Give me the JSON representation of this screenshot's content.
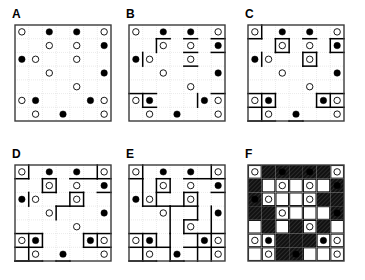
{
  "figure": {
    "grid_size": 7,
    "panel_count": 6,
    "colors": {
      "background": "#ffffff",
      "border": "#3a3a3a",
      "gridline": "#c9c9c9",
      "region_line": "#000000",
      "dot_filled": "#000000",
      "dot_open": "#ffffff",
      "dot_stroke": "#000000",
      "shaded_region": "#111111",
      "label": "#000000"
    }
  },
  "dots": [
    {
      "r": 0,
      "c": 0,
      "type": "open"
    },
    {
      "r": 0,
      "c": 2,
      "type": "filled"
    },
    {
      "r": 0,
      "c": 4,
      "type": "filled"
    },
    {
      "r": 0,
      "c": 6,
      "type": "open"
    },
    {
      "r": 1,
      "c": 2,
      "type": "open"
    },
    {
      "r": 1,
      "c": 4,
      "type": "open"
    },
    {
      "r": 1,
      "c": 6,
      "type": "filled"
    },
    {
      "r": 2,
      "c": 0,
      "type": "filled"
    },
    {
      "r": 2,
      "c": 1,
      "type": "open"
    },
    {
      "r": 2,
      "c": 4,
      "type": "open"
    },
    {
      "r": 3,
      "c": 2,
      "type": "open"
    },
    {
      "r": 3,
      "c": 6,
      "type": "filled"
    },
    {
      "r": 4,
      "c": 4,
      "type": "open"
    },
    {
      "r": 5,
      "c": 0,
      "type": "open"
    },
    {
      "r": 5,
      "c": 1,
      "type": "filled"
    },
    {
      "r": 5,
      "c": 5,
      "type": "filled"
    },
    {
      "r": 5,
      "c": 6,
      "type": "open"
    },
    {
      "r": 6,
      "c": 1,
      "type": "open"
    },
    {
      "r": 6,
      "c": 3,
      "type": "filled"
    },
    {
      "r": 6,
      "c": 6,
      "type": "open"
    },
    {
      "r": 7,
      "c": 2,
      "type": "open"
    },
    {
      "r": 7,
      "c": 5,
      "type": "open"
    }
  ],
  "panels": [
    {
      "id": "a",
      "label": "A",
      "caption": "initial grid with clue dots",
      "shaded": false,
      "cell_labels": [],
      "segments": []
    },
    {
      "id": "b",
      "label": "B",
      "caption": "first deduced region edges",
      "shaded": false,
      "cell_labels": [],
      "segments": [
        {
          "x1": 2,
          "y1": 1,
          "x2": 3,
          "y2": 1
        },
        {
          "x1": 2,
          "y1": 1,
          "x2": 2,
          "y2": 2
        },
        {
          "x1": 4,
          "y1": 1,
          "x2": 5,
          "y2": 1
        },
        {
          "x1": 6,
          "y1": 1,
          "x2": 7,
          "y2": 1
        },
        {
          "x1": 6,
          "y1": 2,
          "x2": 7,
          "y2": 2
        },
        {
          "x1": 1,
          "y1": 2,
          "x2": 1,
          "y2": 3
        },
        {
          "x1": 4,
          "y1": 2,
          "x2": 5,
          "y2": 2
        },
        {
          "x1": 4,
          "y1": 3,
          "x2": 5,
          "y2": 3
        },
        {
          "x1": 1,
          "y1": 5,
          "x2": 1,
          "y2": 6
        },
        {
          "x1": 5,
          "y1": 5,
          "x2": 5,
          "y2": 6
        },
        {
          "x1": 6,
          "y1": 5,
          "x2": 7,
          "y2": 5
        },
        {
          "x1": 0,
          "y1": 5,
          "x2": 2,
          "y2": 5
        },
        {
          "x1": 1,
          "y1": 6,
          "x2": 2,
          "y2": 6
        }
      ]
    },
    {
      "id": "c",
      "label": "C",
      "caption": "more regions closed off",
      "shaded": false,
      "cell_labels": [],
      "segments": [
        {
          "x1": 0,
          "y1": 1,
          "x2": 1,
          "y2": 1
        },
        {
          "x1": 1,
          "y1": 0,
          "x2": 1,
          "y2": 1
        },
        {
          "x1": 2,
          "y1": 1,
          "x2": 3,
          "y2": 1
        },
        {
          "x1": 2,
          "y1": 1,
          "x2": 2,
          "y2": 2
        },
        {
          "x1": 3,
          "y1": 1,
          "x2": 3,
          "y2": 2
        },
        {
          "x1": 2,
          "y1": 2,
          "x2": 3,
          "y2": 2
        },
        {
          "x1": 4,
          "y1": 1,
          "x2": 5,
          "y2": 1
        },
        {
          "x1": 6,
          "y1": 1,
          "x2": 7,
          "y2": 1
        },
        {
          "x1": 6,
          "y1": 1,
          "x2": 6,
          "y2": 2
        },
        {
          "x1": 6,
          "y1": 2,
          "x2": 7,
          "y2": 2
        },
        {
          "x1": 1,
          "y1": 2,
          "x2": 1,
          "y2": 3
        },
        {
          "x1": 4,
          "y1": 2,
          "x2": 5,
          "y2": 2
        },
        {
          "x1": 4,
          "y1": 2,
          "x2": 4,
          "y2": 3
        },
        {
          "x1": 5,
          "y1": 2,
          "x2": 5,
          "y2": 3
        },
        {
          "x1": 4,
          "y1": 3,
          "x2": 5,
          "y2": 3
        },
        {
          "x1": 0,
          "y1": 5,
          "x2": 2,
          "y2": 5
        },
        {
          "x1": 1,
          "y1": 5,
          "x2": 1,
          "y2": 6
        },
        {
          "x1": 2,
          "y1": 5,
          "x2": 2,
          "y2": 6
        },
        {
          "x1": 0,
          "y1": 6,
          "x2": 2,
          "y2": 6
        },
        {
          "x1": 1,
          "y1": 6,
          "x2": 1,
          "y2": 7
        },
        {
          "x1": 0,
          "y1": 7,
          "x2": 2,
          "y2": 7
        },
        {
          "x1": 5,
          "y1": 5,
          "x2": 5,
          "y2": 6
        },
        {
          "x1": 5,
          "y1": 5,
          "x2": 7,
          "y2": 5
        },
        {
          "x1": 6,
          "y1": 5,
          "x2": 6,
          "y2": 6
        },
        {
          "x1": 5,
          "y1": 6,
          "x2": 7,
          "y2": 6
        },
        {
          "x1": 3,
          "y1": 7,
          "x2": 3,
          "y2": 8
        },
        {
          "x1": 4,
          "y1": 7,
          "x2": 4,
          "y2": 8
        },
        {
          "x1": 3,
          "y1": 7,
          "x2": 4,
          "y2": 7
        }
      ]
    },
    {
      "id": "d",
      "label": "D",
      "caption": "case analysis at cells a and b",
      "shaded": false,
      "cell_labels": [
        {
          "r": 7,
          "c": 0,
          "text": "a"
        },
        {
          "r": 7,
          "c": 2,
          "text": "b"
        }
      ],
      "segments": [
        {
          "x1": 0,
          "y1": 1,
          "x2": 1,
          "y2": 1
        },
        {
          "x1": 1,
          "y1": 0,
          "x2": 1,
          "y2": 1
        },
        {
          "x1": 2,
          "y1": 1,
          "x2": 3,
          "y2": 1
        },
        {
          "x1": 2,
          "y1": 1,
          "x2": 2,
          "y2": 2
        },
        {
          "x1": 3,
          "y1": 1,
          "x2": 3,
          "y2": 2
        },
        {
          "x1": 2,
          "y1": 2,
          "x2": 3,
          "y2": 2
        },
        {
          "x1": 4,
          "y1": 1,
          "x2": 6,
          "y2": 1
        },
        {
          "x1": 6,
          "y1": 0,
          "x2": 6,
          "y2": 1
        },
        {
          "x1": 6,
          "y1": 1,
          "x2": 7,
          "y2": 1
        },
        {
          "x1": 6,
          "y1": 2,
          "x2": 7,
          "y2": 2
        },
        {
          "x1": 1,
          "y1": 2,
          "x2": 1,
          "y2": 3
        },
        {
          "x1": 4,
          "y1": 2,
          "x2": 5,
          "y2": 2
        },
        {
          "x1": 4,
          "y1": 2,
          "x2": 4,
          "y2": 3
        },
        {
          "x1": 5,
          "y1": 2,
          "x2": 5,
          "y2": 3
        },
        {
          "x1": 3,
          "y1": 3,
          "x2": 5,
          "y2": 3
        },
        {
          "x1": 3,
          "y1": 3,
          "x2": 3,
          "y2": 4
        },
        {
          "x1": 0,
          "y1": 5,
          "x2": 2,
          "y2": 5
        },
        {
          "x1": 1,
          "y1": 5,
          "x2": 1,
          "y2": 6
        },
        {
          "x1": 2,
          "y1": 5,
          "x2": 2,
          "y2": 6
        },
        {
          "x1": 0,
          "y1": 6,
          "x2": 2,
          "y2": 6
        },
        {
          "x1": 1,
          "y1": 6,
          "x2": 1,
          "y2": 7
        },
        {
          "x1": 0,
          "y1": 7,
          "x2": 2,
          "y2": 7
        },
        {
          "x1": 5,
          "y1": 5,
          "x2": 5,
          "y2": 6
        },
        {
          "x1": 5,
          "y1": 5,
          "x2": 7,
          "y2": 5
        },
        {
          "x1": 6,
          "y1": 5,
          "x2": 6,
          "y2": 6
        },
        {
          "x1": 5,
          "y1": 6,
          "x2": 7,
          "y2": 6
        },
        {
          "x1": 0,
          "y1": 7,
          "x2": 1,
          "y2": 7
        },
        {
          "x1": 1,
          "y1": 7,
          "x2": 1,
          "y2": 8
        },
        {
          "x1": 2,
          "y1": 7,
          "x2": 2,
          "y2": 8
        },
        {
          "x1": 3,
          "y1": 7,
          "x2": 3,
          "y2": 8
        },
        {
          "x1": 4,
          "y1": 7,
          "x2": 4,
          "y2": 8
        },
        {
          "x1": 3,
          "y1": 7,
          "x2": 4,
          "y2": 7
        }
      ]
    },
    {
      "id": "e",
      "label": "E",
      "caption": "completed domino partition",
      "shaded": false,
      "cell_labels": [],
      "segments": [
        {
          "x1": 0,
          "y1": 1,
          "x2": 1,
          "y2": 1
        },
        {
          "x1": 1,
          "y1": 0,
          "x2": 1,
          "y2": 1
        },
        {
          "x1": 2,
          "y1": 1,
          "x2": 3,
          "y2": 1
        },
        {
          "x1": 2,
          "y1": 1,
          "x2": 2,
          "y2": 3
        },
        {
          "x1": 3,
          "y1": 1,
          "x2": 3,
          "y2": 2
        },
        {
          "x1": 2,
          "y1": 2,
          "x2": 3,
          "y2": 2
        },
        {
          "x1": 4,
          "y1": 1,
          "x2": 6,
          "y2": 1
        },
        {
          "x1": 6,
          "y1": 0,
          "x2": 6,
          "y2": 1
        },
        {
          "x1": 6,
          "y1": 1,
          "x2": 7,
          "y2": 1
        },
        {
          "x1": 6,
          "y1": 2,
          "x2": 7,
          "y2": 2
        },
        {
          "x1": 1,
          "y1": 1,
          "x2": 1,
          "y2": 3
        },
        {
          "x1": 4,
          "y1": 2,
          "x2": 5,
          "y2": 2
        },
        {
          "x1": 4,
          "y1": 2,
          "x2": 4,
          "y2": 3
        },
        {
          "x1": 5,
          "y1": 2,
          "x2": 5,
          "y2": 3
        },
        {
          "x1": 1,
          "y1": 3,
          "x2": 3,
          "y2": 3
        },
        {
          "x1": 3,
          "y1": 3,
          "x2": 5,
          "y2": 3
        },
        {
          "x1": 3,
          "y1": 3,
          "x2": 3,
          "y2": 5
        },
        {
          "x1": 5,
          "y1": 3,
          "x2": 5,
          "y2": 4
        },
        {
          "x1": 4,
          "y1": 4,
          "x2": 5,
          "y2": 4
        },
        {
          "x1": 4,
          "y1": 4,
          "x2": 4,
          "y2": 5
        },
        {
          "x1": 6,
          "y1": 3,
          "x2": 6,
          "y2": 5
        },
        {
          "x1": 0,
          "y1": 5,
          "x2": 2,
          "y2": 5
        },
        {
          "x1": 1,
          "y1": 5,
          "x2": 1,
          "y2": 6
        },
        {
          "x1": 2,
          "y1": 5,
          "x2": 2,
          "y2": 6
        },
        {
          "x1": 0,
          "y1": 6,
          "x2": 2,
          "y2": 6
        },
        {
          "x1": 1,
          "y1": 6,
          "x2": 1,
          "y2": 7
        },
        {
          "x1": 0,
          "y1": 7,
          "x2": 2,
          "y2": 7
        },
        {
          "x1": 2,
          "y1": 6,
          "x2": 3,
          "y2": 6
        },
        {
          "x1": 3,
          "y1": 5,
          "x2": 3,
          "y2": 7
        },
        {
          "x1": 5,
          "y1": 5,
          "x2": 5,
          "y2": 6
        },
        {
          "x1": 4,
          "y1": 5,
          "x2": 7,
          "y2": 5
        },
        {
          "x1": 6,
          "y1": 5,
          "x2": 6,
          "y2": 6
        },
        {
          "x1": 5,
          "y1": 6,
          "x2": 7,
          "y2": 6
        },
        {
          "x1": 4,
          "y1": 6,
          "x2": 5,
          "y2": 6
        },
        {
          "x1": 2,
          "y1": 7,
          "x2": 2,
          "y2": 8
        },
        {
          "x1": 1,
          "y1": 7,
          "x2": 1,
          "y2": 8
        },
        {
          "x1": 3,
          "y1": 7,
          "x2": 3,
          "y2": 8
        },
        {
          "x1": 4,
          "y1": 7,
          "x2": 4,
          "y2": 8
        },
        {
          "x1": 3,
          "y1": 7,
          "x2": 4,
          "y2": 7
        },
        {
          "x1": 5,
          "y1": 6,
          "x2": 5,
          "y2": 8
        },
        {
          "x1": 6,
          "y1": 6,
          "x2": 6,
          "y2": 7
        }
      ]
    },
    {
      "id": "f",
      "label": "F",
      "caption": "final solution with shaded regions",
      "shaded": true,
      "cell_labels": [],
      "segments": []
    }
  ],
  "shading": {
    "note": "Cells marked true are shaded/hatched black in panel F",
    "cells": [
      [
        false,
        true,
        true,
        true,
        true,
        true,
        false
      ],
      [
        true,
        false,
        false,
        false,
        false,
        false,
        true
      ],
      [
        true,
        false,
        false,
        false,
        false,
        true,
        true
      ],
      [
        true,
        true,
        false,
        false,
        false,
        false,
        true
      ],
      [
        false,
        true,
        false,
        true,
        false,
        true,
        false
      ],
      [
        false,
        false,
        true,
        true,
        true,
        false,
        false
      ],
      [
        false,
        false,
        true,
        true,
        false,
        false,
        false
      ]
    ]
  }
}
